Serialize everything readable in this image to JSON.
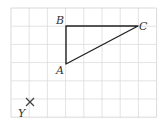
{
  "diagram": {
    "grid": {
      "columns": 8,
      "rows": 6,
      "cell_size": 18.2,
      "origin_x": 11,
      "origin_y": 8,
      "line_color": "#dcdcdc",
      "border_color": "#d0d0d0"
    },
    "triangle": {
      "stroke_color": "#222222",
      "vertices": {
        "A": {
          "label": "A",
          "x": 66,
          "y": 64
        },
        "B": {
          "label": "B",
          "x": 66,
          "y": 26
        },
        "C": {
          "label": "C",
          "x": 138,
          "y": 26
        }
      }
    },
    "marker": {
      "label": "Y",
      "symbol": "×",
      "x": 30,
      "y": 102
    }
  }
}
